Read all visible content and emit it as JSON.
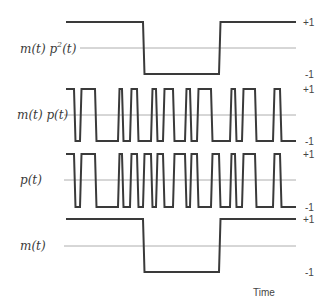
{
  "diagram": {
    "x_axis_label": "Time",
    "level_high_label": "+1",
    "level_low_label": "-1",
    "wave_color": "#3a3a3a",
    "zero_line_color": "#9a9a9a",
    "x_start": 66,
    "x_end": 296,
    "panels": [
      {
        "id": "m_p2",
        "label": "m(t)p²(t)",
        "label_main": "m(t) p",
        "label_sup": "2",
        "label_tail": "(t)",
        "y_high": 22,
        "y_low": 74,
        "y_mid": 48,
        "initial": 1,
        "transitions": [
          143,
          219
        ]
      },
      {
        "id": "m_p",
        "label": "m(t) p(t)",
        "y_high": 89,
        "y_low": 141,
        "y_mid": 115,
        "initial": 1,
        "transitions": [
          74,
          80,
          95,
          118,
          122,
          130,
          137,
          151,
          156,
          163,
          173,
          185,
          190,
          197,
          211,
          230,
          235,
          242,
          255,
          273,
          280
        ]
      },
      {
        "id": "p",
        "label": "p(t)",
        "y_high": 154,
        "y_low": 207,
        "y_mid": 180,
        "initial": 1,
        "transitions": [
          74,
          80,
          95,
          118,
          122,
          130,
          137,
          143,
          151,
          156,
          163,
          173,
          185,
          190,
          197,
          211,
          219,
          230,
          235,
          242,
          255,
          273,
          280
        ]
      },
      {
        "id": "m",
        "label": "m(t)",
        "y_high": 219,
        "y_low": 272,
        "y_mid": 246,
        "initial": 1,
        "transitions": [
          143,
          219
        ]
      }
    ]
  }
}
